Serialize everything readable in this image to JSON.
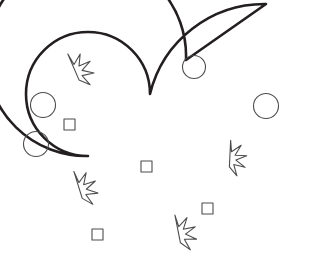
{
  "canvas": {
    "width": 309,
    "height": 271,
    "background_color": "#ffffff",
    "title": "Spiral shell line drawing with stars, circles and squares"
  },
  "artwork": {
    "name": "spiral-shell",
    "style": "black outline line art on white background",
    "stroke_color": "#231f20",
    "decor_stroke_color": "#4d4d4d",
    "fill_color": "#ffffff",
    "outline_stroke_width": 2.6,
    "decor_stroke_width": 1.1,
    "shell_path": "M 266 4 L 186 60 A 100 100 0 1 0 88 156 A 62 62 0 1 1 150 94 A 118 118 0 0 1 266 4 Z",
    "apex_point": {
      "x": 266,
      "y": 4
    },
    "inner_tail_point": {
      "x": 88,
      "y": 156
    }
  },
  "decorations": {
    "stars": [
      {
        "id": "star-upper-left",
        "cx": 74,
        "cy": 73,
        "r_outer": 20,
        "r_inner": 8.5,
        "rotation": -18
      },
      {
        "id": "star-lower-left",
        "cx": 78,
        "cy": 191,
        "r_outer": 20,
        "r_inner": 8.5,
        "rotation": -12
      },
      {
        "id": "star-right",
        "cx": 228,
        "cy": 159,
        "r_outer": 19,
        "r_inner": 8,
        "rotation": 8
      },
      {
        "id": "star-bottom",
        "cx": 177,
        "cy": 235,
        "r_outer": 20,
        "r_inner": 8.5,
        "rotation": -6
      }
    ],
    "circles": [
      {
        "id": "circle-left-upper",
        "cx": 43,
        "cy": 105,
        "r": 12.5
      },
      {
        "id": "circle-left-lower",
        "cx": 36,
        "cy": 144,
        "r": 12.5
      },
      {
        "id": "circle-top-right",
        "cx": 194,
        "cy": 67,
        "r": 11.5
      },
      {
        "id": "circle-far-right",
        "cx": 266,
        "cy": 106,
        "r": 12.5
      }
    ],
    "squares": [
      {
        "id": "square-upper-left",
        "x": 64,
        "y": 119,
        "size": 11
      },
      {
        "id": "square-center",
        "x": 141,
        "y": 161,
        "size": 11
      },
      {
        "id": "square-bottom-left",
        "x": 92,
        "y": 229,
        "size": 11
      },
      {
        "id": "square-bottom-right",
        "x": 202,
        "y": 203,
        "size": 11
      }
    ]
  }
}
